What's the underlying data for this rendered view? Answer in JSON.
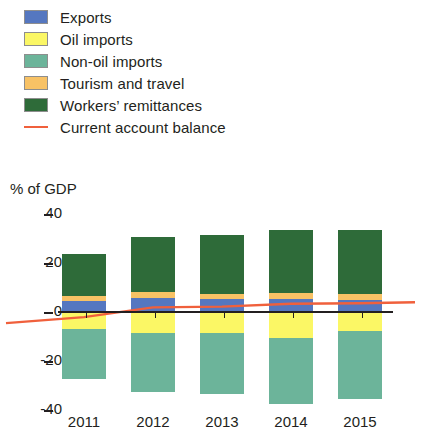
{
  "legend": {
    "items": [
      {
        "label": "Exports",
        "color": "#5577c0",
        "type": "swatch",
        "name": "exports"
      },
      {
        "label": "Oil imports",
        "color": "#fbf765",
        "type": "swatch",
        "name": "oil-imports"
      },
      {
        "label": "Non-oil imports",
        "color": "#6cb49a",
        "type": "swatch",
        "name": "non-oil-imports"
      },
      {
        "label": "Tourism and travel",
        "color": "#f8c265",
        "type": "swatch",
        "name": "tourism-and-travel"
      },
      {
        "label": "Workers’ remittances",
        "color": "#2e6b39",
        "type": "swatch",
        "name": "workers-remittances"
      },
      {
        "label": "Current account balance",
        "color": "#f0603c",
        "type": "line",
        "name": "current-account-balance"
      }
    ]
  },
  "chart_data": {
    "type": "bar",
    "title": "",
    "subtitle": "",
    "ylabel": "% of GDP",
    "xlabel": "",
    "categories": [
      "2011",
      "2012",
      "2013",
      "2014",
      "2015"
    ],
    "ylim": [
      -40,
      40
    ],
    "yticks": [
      40,
      20,
      0,
      -20,
      -40
    ],
    "grid": false,
    "legend_position": "top-left",
    "stacked": true,
    "series": [
      {
        "name": "Exports",
        "color": "#5577c0",
        "values": [
          4.2,
          5.5,
          5.0,
          5.0,
          4.5
        ]
      },
      {
        "name": "Oil imports",
        "color": "#fbf765",
        "values": [
          -7.5,
          -9.0,
          -9.0,
          -11.0,
          -8.0
        ]
      },
      {
        "name": "Non-oil imports",
        "color": "#6cb49a",
        "values": [
          -20.5,
          -24.0,
          -25.0,
          -27.0,
          -28.0
        ]
      },
      {
        "name": "Tourism and travel",
        "color": "#f8c265",
        "values": [
          2.0,
          2.2,
          2.0,
          2.5,
          2.5
        ]
      },
      {
        "name": "Workers’ remittances",
        "color": "#2e6b39",
        "values": [
          17.0,
          22.5,
          24.0,
          25.5,
          26.0
        ]
      }
    ],
    "line_series": {
      "name": "Current account balance",
      "color": "#f0603c",
      "values": [
        -2.5,
        1.5,
        1.8,
        3.0,
        3.2
      ]
    }
  }
}
